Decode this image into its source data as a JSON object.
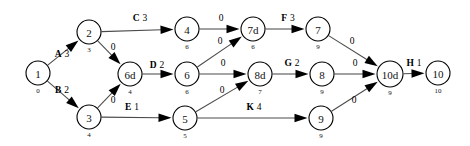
{
  "diagram": {
    "type": "activity-network",
    "background_color": "#ffffff",
    "node_stroke_color": "#000000",
    "edge_color": "#4a4a4a",
    "arrow_color": "#000000",
    "nodes": [
      {
        "id": "n1",
        "label": "1",
        "sub": "0",
        "cx": 38,
        "cy": 73,
        "r": 12
      },
      {
        "id": "n2",
        "label": "2",
        "sub": "3",
        "cx": 89,
        "cy": 32,
        "r": 12
      },
      {
        "id": "n3",
        "label": "3",
        "sub": "4",
        "cx": 89,
        "cy": 117,
        "r": 12
      },
      {
        "id": "n6d",
        "label": "6d",
        "sub": "4",
        "cx": 130,
        "cy": 74,
        "r": 12
      },
      {
        "id": "n4",
        "label": "4",
        "sub": "6",
        "cx": 187,
        "cy": 29,
        "r": 12
      },
      {
        "id": "n6",
        "label": "6",
        "sub": "6",
        "cx": 187,
        "cy": 74,
        "r": 12
      },
      {
        "id": "n5",
        "label": "5",
        "sub": "5",
        "cx": 185,
        "cy": 118,
        "r": 12
      },
      {
        "id": "n7d",
        "label": "7d",
        "sub": "6",
        "cx": 253,
        "cy": 29,
        "r": 12
      },
      {
        "id": "n8d",
        "label": "8d",
        "sub": "7",
        "cx": 260,
        "cy": 74,
        "r": 12
      },
      {
        "id": "n7",
        "label": "7",
        "sub": "9",
        "cx": 318,
        "cy": 29,
        "r": 12
      },
      {
        "id": "n8",
        "label": "8",
        "sub": "9",
        "cx": 322,
        "cy": 74,
        "r": 12
      },
      {
        "id": "n9",
        "label": "9",
        "sub": "9",
        "cx": 321,
        "cy": 118,
        "r": 12
      },
      {
        "id": "n10d",
        "label": "10d",
        "sub": "9",
        "cx": 390,
        "cy": 74,
        "r": 13
      },
      {
        "id": "n10",
        "label": "10",
        "sub": "10",
        "cx": 438,
        "cy": 73,
        "r": 12
      }
    ],
    "edges": [
      {
        "id": "e-a",
        "from": "n1",
        "to": "n2",
        "name": "A",
        "duration": "3",
        "label": "A 3",
        "is_dummy": false,
        "label_x": 62,
        "label_y": 57
      },
      {
        "id": "e-b",
        "from": "n1",
        "to": "n3",
        "name": "B",
        "duration": "2",
        "label": "B 2",
        "is_dummy": false,
        "label_x": 62,
        "label_y": 93
      },
      {
        "id": "e-c",
        "from": "n2",
        "to": "n4",
        "name": "C",
        "duration": "3",
        "label": "C 3",
        "is_dummy": false,
        "label_x": 140,
        "label_y": 21
      },
      {
        "id": "e-2-6d",
        "from": "n2",
        "to": "n6d",
        "name": "",
        "duration": "0",
        "label": "0",
        "is_dummy": true,
        "label_x": 113,
        "label_y": 50
      },
      {
        "id": "e-3-6d",
        "from": "n3",
        "to": "n6d",
        "name": "",
        "duration": "0",
        "label": "0",
        "is_dummy": true,
        "label_x": 113,
        "label_y": 103
      },
      {
        "id": "e-d",
        "from": "n6d",
        "to": "n6",
        "name": "D",
        "duration": "2",
        "label": "D 2",
        "is_dummy": false,
        "label_x": 157,
        "label_y": 68
      },
      {
        "id": "e-e",
        "from": "n3",
        "to": "n5",
        "name": "E",
        "duration": "1",
        "label": "E 1",
        "is_dummy": false,
        "label_x": 132,
        "label_y": 110
      },
      {
        "id": "e-4-7d",
        "from": "n4",
        "to": "n7d",
        "name": "",
        "duration": "0",
        "label": "0",
        "is_dummy": true,
        "label_x": 221,
        "label_y": 21
      },
      {
        "id": "e-6-7d",
        "from": "n6",
        "to": "n7d",
        "name": "",
        "duration": "0",
        "label": "0",
        "is_dummy": true,
        "label_x": 220,
        "label_y": 44
      },
      {
        "id": "e-6-8d",
        "from": "n6",
        "to": "n8d",
        "name": "",
        "duration": "0",
        "label": "0",
        "is_dummy": true,
        "label_x": 223,
        "label_y": 66
      },
      {
        "id": "e-5-8d",
        "from": "n5",
        "to": "n8d",
        "name": "",
        "duration": "0",
        "label": "0",
        "is_dummy": true,
        "label_x": 222,
        "label_y": 93
      },
      {
        "id": "e-f",
        "from": "n7d",
        "to": "n7",
        "name": "F",
        "duration": "3",
        "label": "F 3",
        "is_dummy": false,
        "label_x": 288,
        "label_y": 21
      },
      {
        "id": "e-g",
        "from": "n8d",
        "to": "n8",
        "name": "G",
        "duration": "2",
        "label": "G 2",
        "is_dummy": false,
        "label_x": 292,
        "label_y": 66
      },
      {
        "id": "e-k",
        "from": "n5",
        "to": "n9",
        "name": "K",
        "duration": "4",
        "label": "K 4",
        "is_dummy": false,
        "label_x": 254,
        "label_y": 110
      },
      {
        "id": "e-7-10d",
        "from": "n7",
        "to": "n10d",
        "name": "",
        "duration": "0",
        "label": "0",
        "is_dummy": true,
        "label_x": 352,
        "label_y": 44
      },
      {
        "id": "e-8-10d",
        "from": "n8",
        "to": "n10d",
        "name": "",
        "duration": "0",
        "label": "0",
        "is_dummy": true,
        "label_x": 355,
        "label_y": 66
      },
      {
        "id": "e-9-10d",
        "from": "n9",
        "to": "n10d",
        "name": "",
        "duration": "0",
        "label": "0",
        "is_dummy": true,
        "label_x": 354,
        "label_y": 103
      },
      {
        "id": "e-h",
        "from": "n10d",
        "to": "n10",
        "name": "H",
        "duration": "1",
        "label": "H 1",
        "is_dummy": false,
        "label_x": 414,
        "label_y": 66
      }
    ]
  }
}
